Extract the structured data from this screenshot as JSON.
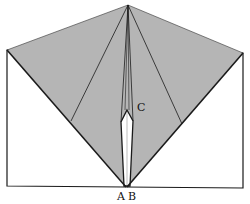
{
  "diagram": {
    "type": "origami-fold-diagram",
    "colors": {
      "paper_shaded": "#b5b5b5",
      "paper_white": "#ffffff",
      "line": "#1a1a1a"
    },
    "labels": {
      "a": "A",
      "b": "B",
      "c": "C"
    }
  }
}
